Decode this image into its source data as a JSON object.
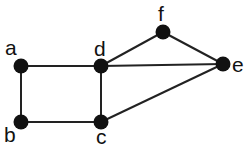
{
  "diagram": {
    "type": "undirected-graph",
    "colors": {
      "node": "#111111",
      "edge": "#222222",
      "background": "#ffffff",
      "label": "#111111"
    },
    "nodes": [
      {
        "id": "a",
        "label": "a",
        "x": 21,
        "y": 66,
        "lx": 5,
        "ly": 55
      },
      {
        "id": "b",
        "label": "b",
        "x": 21,
        "y": 122,
        "lx": 4,
        "ly": 142
      },
      {
        "id": "c",
        "label": "c",
        "x": 101,
        "y": 122,
        "lx": 96,
        "ly": 144
      },
      {
        "id": "d",
        "label": "d",
        "x": 101,
        "y": 66,
        "lx": 94,
        "ly": 56
      },
      {
        "id": "e",
        "label": "e",
        "x": 223,
        "y": 64,
        "lx": 232,
        "ly": 72
      },
      {
        "id": "f",
        "label": "f",
        "x": 163,
        "y": 32,
        "lx": 158,
        "ly": 21
      }
    ],
    "edges": [
      {
        "from": "a",
        "to": "d"
      },
      {
        "from": "a",
        "to": "b"
      },
      {
        "from": "b",
        "to": "c"
      },
      {
        "from": "c",
        "to": "d"
      },
      {
        "from": "d",
        "to": "f"
      },
      {
        "from": "d",
        "to": "e"
      },
      {
        "from": "f",
        "to": "e"
      },
      {
        "from": "c",
        "to": "e"
      }
    ]
  }
}
